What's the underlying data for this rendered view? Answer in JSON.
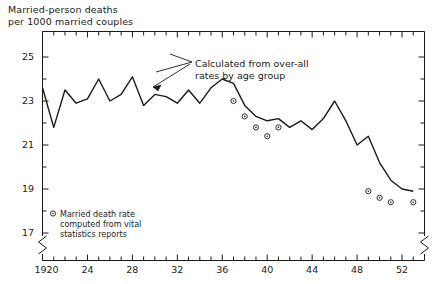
{
  "figure": {
    "axis_title_line1": "Married-person deaths",
    "axis_title_line2": "per 1000 married couples",
    "annotation_line1": "Calculated from over-all",
    "annotation_line2": "rates by age group",
    "legend_line1": "Married death rate",
    "legend_line2": "computed from vital",
    "legend_line3": "statistics reports",
    "legend_marker": "circle-dot-marker",
    "line_color": "#1a1a1a",
    "background": "#ffffff"
  },
  "chart_data": {
    "type": "line",
    "title": "Married-person deaths per 1000 married couples",
    "xlabel": "",
    "ylabel": "Married-person deaths per 1000 married couples",
    "xlim": [
      1920,
      1954
    ],
    "ylim": [
      16.6,
      25.6
    ],
    "grid": false,
    "legend_position": "inside-bottom-left",
    "y_ticks_major": [
      17,
      19,
      21,
      23,
      25
    ],
    "y_ticks_minor": [
      18,
      20,
      22,
      24
    ],
    "x_ticks_major": [
      1920,
      1924,
      1928,
      1932,
      1936,
      1940,
      1944,
      1948,
      1952
    ],
    "x_tick_labels": [
      "1920",
      "24",
      "28",
      "32",
      "36",
      "40",
      "44",
      "48",
      "52"
    ],
    "x_ticks_minor": [
      1921,
      1922,
      1923,
      1925,
      1926,
      1927,
      1929,
      1930,
      1931,
      1933,
      1934,
      1935,
      1937,
      1938,
      1939,
      1941,
      1942,
      1943,
      1945,
      1946,
      1947,
      1949,
      1950,
      1951,
      1953
    ],
    "axis_break_y": true,
    "series": [
      {
        "name": "Calculated from over-all rates by age group",
        "marker": "none",
        "x": [
          1920,
          1921,
          1922,
          1923,
          1924,
          1925,
          1926,
          1927,
          1928,
          1929,
          1930,
          1931,
          1932,
          1933,
          1934,
          1935,
          1936,
          1937,
          1938,
          1939,
          1940,
          1941,
          1942,
          1943,
          1944,
          1945,
          1946,
          1947,
          1948,
          1949,
          1950,
          1951,
          1952,
          1953
        ],
        "values": [
          23.6,
          21.8,
          23.5,
          22.9,
          23.1,
          24.0,
          23.0,
          23.3,
          24.1,
          22.8,
          23.3,
          23.2,
          22.9,
          23.5,
          22.9,
          23.6,
          24.0,
          23.8,
          22.8,
          22.3,
          22.1,
          22.2,
          21.8,
          22.1,
          21.7,
          22.2,
          23.0,
          22.1,
          21.0,
          21.4,
          20.2,
          19.4,
          19.0,
          18.9
        ]
      },
      {
        "name": "Married death rate computed from vital statistics reports",
        "marker": "circle",
        "x": [
          1937,
          1938,
          1939,
          1940,
          1941,
          1949,
          1950,
          1951,
          1953
        ],
        "values": [
          23.0,
          22.3,
          21.8,
          21.4,
          21.8,
          18.9,
          18.6,
          18.4,
          18.4
        ]
      }
    ]
  }
}
